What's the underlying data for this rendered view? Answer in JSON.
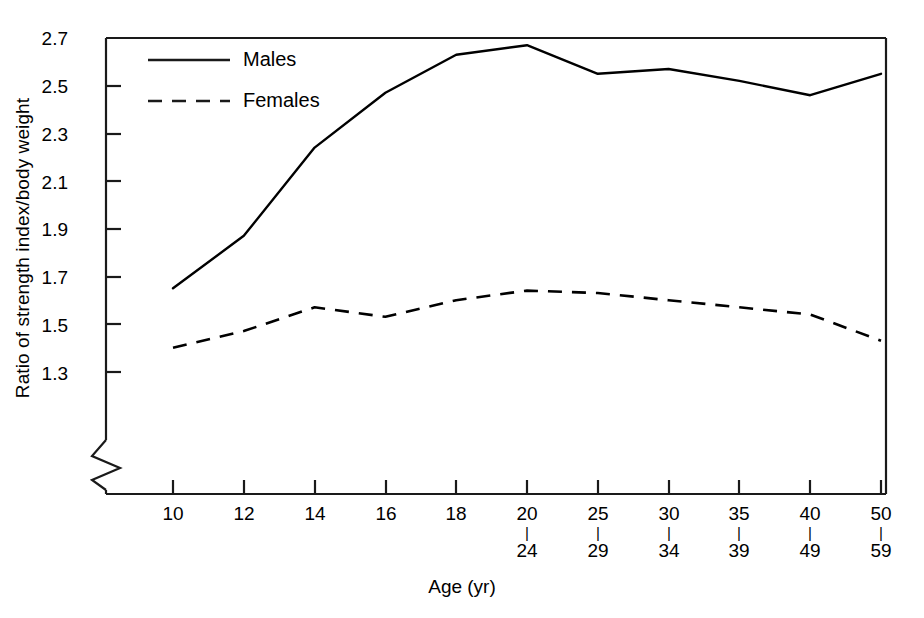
{
  "chart_data": {
    "type": "line",
    "title": "",
    "xlabel": "Age (yr)",
    "ylabel": "Ratio of strength index/body weight",
    "categories": [
      "10",
      "12",
      "14",
      "16",
      "18",
      "20-24",
      "25-29",
      "30-34",
      "35-39",
      "40-49",
      "50-59"
    ],
    "x_tick_top": [
      "10",
      "12",
      "14",
      "16",
      "18",
      "20",
      "25",
      "30",
      "35",
      "40",
      "50"
    ],
    "x_tick_bottom": [
      "",
      "",
      "",
      "",
      "",
      "24",
      "29",
      "34",
      "39",
      "49",
      "59"
    ],
    "x_tick_separator": "|",
    "ylim": [
      1.3,
      2.7
    ],
    "y_ticks": [
      "1.3",
      "1.5",
      "1.7",
      "1.9",
      "2.1",
      "2.3",
      "2.5",
      "2.7"
    ],
    "y_axis_break": true,
    "grid": false,
    "legend_position": "top-left-inside",
    "series": [
      {
        "name": "Males",
        "style": "solid",
        "color": "#000000",
        "values": [
          1.65,
          1.87,
          2.24,
          2.47,
          2.63,
          2.67,
          2.55,
          2.57,
          2.52,
          2.46,
          2.55
        ]
      },
      {
        "name": "Females",
        "style": "dashed",
        "color": "#000000",
        "values": [
          1.4,
          1.47,
          1.57,
          1.53,
          1.6,
          1.64,
          1.63,
          1.6,
          1.57,
          1.54,
          1.43
        ]
      }
    ]
  },
  "legend": {
    "items": [
      {
        "label": "Males",
        "style": "solid"
      },
      {
        "label": "Females",
        "style": "dashed"
      }
    ]
  },
  "axes": {
    "y_title": "Ratio of strength index/body weight",
    "x_title": "Age (yr)",
    "y_ticks": [
      "2.7",
      "2.5",
      "2.3",
      "2.1",
      "1.9",
      "1.7",
      "1.5",
      "1.3"
    ],
    "x_ticks_top": [
      "10",
      "12",
      "14",
      "16",
      "18",
      "20",
      "25",
      "30",
      "35",
      "40",
      "50"
    ],
    "x_ticks_bottom": [
      "24",
      "29",
      "34",
      "39",
      "49",
      "59"
    ],
    "separator_glyph": "|"
  },
  "colors": {
    "line": "#1a1a1a",
    "axis": "#1a1a1a",
    "background": "#ffffff"
  }
}
